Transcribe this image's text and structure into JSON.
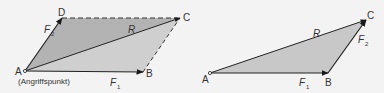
{
  "colors": {
    "background": "#f3f3f3",
    "upper_triangle_fill": "#b3b3b3",
    "lower_triangle_fill": "#cfcfcf",
    "right_triangle_fill": "#c8c8c8",
    "stroke": "#2a2a2a",
    "label": "#333333"
  },
  "left_figure": {
    "title": "Kräfteparallelogramm",
    "points": {
      "A": {
        "label": "A",
        "x": 25,
        "y": 71
      },
      "B": {
        "label": "B",
        "x": 143,
        "y": 72
      },
      "C": {
        "label": "C",
        "x": 180,
        "y": 18
      },
      "D": {
        "label": "D",
        "x": 62,
        "y": 18
      }
    },
    "vectors": {
      "F1": {
        "label": "F",
        "sub": "1"
      },
      "F2": {
        "label": "F",
        "sub": "2"
      },
      "R": {
        "label": "R"
      }
    },
    "annotation": "(Angriffspunkt)"
  },
  "right_figure": {
    "title": "Kräftedreieck",
    "points": {
      "A": {
        "label": "A",
        "x": 210,
        "y": 73
      },
      "B": {
        "label": "B",
        "x": 328,
        "y": 73
      },
      "C": {
        "label": "C",
        "x": 366,
        "y": 20
      }
    },
    "vectors": {
      "F1": {
        "label": "F",
        "sub": "1"
      },
      "F2": {
        "label": "F",
        "sub": "2"
      },
      "R": {
        "label": "R"
      }
    }
  }
}
